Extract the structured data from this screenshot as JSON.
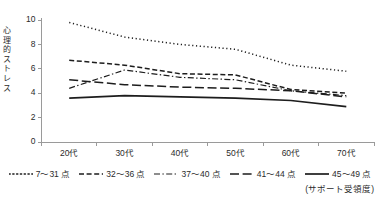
{
  "chart_data": {
    "type": "line",
    "title": "",
    "subtitle": "",
    "xlabel": "",
    "ylabel": "心理的ストレス",
    "categories": [
      "20代",
      "30代",
      "40代",
      "50代",
      "60代",
      "70代"
    ],
    "ylim": [
      0,
      10
    ],
    "yticks": [
      0,
      2,
      4,
      6,
      8,
      10
    ],
    "ytick_labels": [
      "0",
      "2",
      "4",
      "6",
      "8",
      "10"
    ],
    "grid": false,
    "legend_position": "bottom",
    "legend_note": "(サポート受領度)",
    "series": [
      {
        "name": "7〜31 点",
        "dash": "dotted",
        "values": [
          9.8,
          8.6,
          8.0,
          7.6,
          6.3,
          5.8
        ]
      },
      {
        "name": "32〜36 点",
        "dash": "dashed",
        "values": [
          6.7,
          6.3,
          5.6,
          5.5,
          4.3,
          4.0
        ]
      },
      {
        "name": "37〜40 点",
        "dash": "dash-dot",
        "values": [
          4.4,
          5.9,
          5.3,
          5.1,
          4.2,
          3.8
        ]
      },
      {
        "name": "41〜44 点",
        "dash": "long-dash",
        "values": [
          5.1,
          4.7,
          4.5,
          4.4,
          4.2,
          3.7
        ]
      },
      {
        "name": "45〜49 点",
        "dash": "solid",
        "values": [
          3.6,
          3.8,
          3.7,
          3.6,
          3.4,
          2.9
        ]
      }
    ]
  },
  "axes": {
    "y_axis_title_chars": "心理的ストレス"
  }
}
